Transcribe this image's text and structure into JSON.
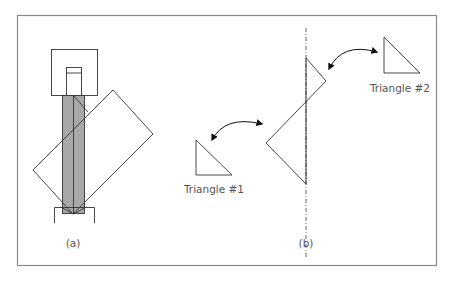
{
  "figure": {
    "panel_a": {
      "label": "(a)"
    },
    "panel_b": {
      "label": "(b)",
      "triangle_1": {
        "label": "Triangle #1"
      },
      "triangle_2": {
        "label": "Triangle #2"
      }
    }
  },
  "colors": {
    "frame": "#8a8a8a",
    "line": "#333333",
    "bar_fill": "#a8a8a8",
    "text": "#555555"
  }
}
